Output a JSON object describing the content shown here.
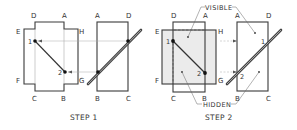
{
  "figure": {
    "colors": {
      "line": "#3a3a3a",
      "rod": "#555555",
      "shade": "#ebebeb",
      "text": "#333333"
    },
    "step1": {
      "caption": "STEP 1",
      "front_view": {
        "corner_labels": {
          "D": "D",
          "A": "A",
          "E": "E",
          "H": "H",
          "F": "F",
          "G": "G",
          "C": "C",
          "B": "B"
        },
        "points": {
          "p1": "1",
          "p2": "2"
        }
      },
      "side_view": {
        "corner_labels": {
          "A": "A",
          "D": "D",
          "B": "B",
          "C": "C"
        }
      }
    },
    "step2": {
      "caption": "STEP 2",
      "annotations": {
        "visible": "VISIBLE",
        "hidden": "HIDDEN"
      },
      "front_view": {
        "corner_labels": {
          "D": "D",
          "A": "A",
          "E": "E",
          "H": "H",
          "F": "F",
          "G": "G",
          "C": "C",
          "B": "B"
        },
        "points": {
          "p1": "1",
          "p2": "2"
        }
      },
      "side_view": {
        "corner_labels": {
          "A": "A",
          "D": "D",
          "B": "B",
          "C": "C"
        },
        "points": {
          "p1": "1",
          "p2": "2"
        }
      }
    }
  }
}
